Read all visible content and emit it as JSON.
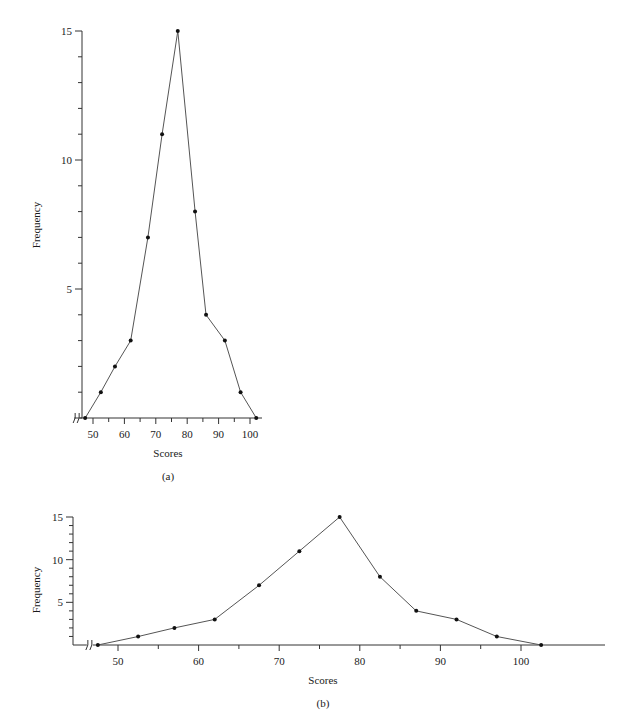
{
  "chart_data": [
    {
      "id": "a",
      "type": "line",
      "caption": "(a)",
      "title": "",
      "xlabel": "Scores",
      "ylabel": "Frequency",
      "x_ticks": [
        50,
        60,
        70,
        80,
        90,
        100
      ],
      "y_ticks": [
        5,
        10,
        15
      ],
      "y_minor_step": 1,
      "xlim": [
        45,
        104
      ],
      "ylim": [
        0,
        15
      ],
      "axis_break": true,
      "grid": false,
      "x": [
        47.5,
        52.5,
        57,
        62,
        67.5,
        72,
        77,
        82.5,
        86,
        92,
        97,
        102
      ],
      "values": [
        0,
        1,
        2,
        3,
        7,
        11,
        15,
        8,
        4,
        3,
        1,
        0
      ]
    },
    {
      "id": "b",
      "type": "line",
      "caption": "(b)",
      "title": "",
      "xlabel": "Scores",
      "ylabel": "Frequency",
      "x_ticks": [
        50,
        60,
        70,
        80,
        90,
        100
      ],
      "y_ticks": [
        5,
        10,
        15
      ],
      "y_minor_step": 1,
      "xlim": [
        45,
        105
      ],
      "ylim": [
        0,
        15
      ],
      "axis_break": true,
      "grid": false,
      "x": [
        47.5,
        52.5,
        57,
        62,
        67.5,
        72.5,
        77.5,
        82.5,
        87,
        92,
        97,
        102.5
      ],
      "values": [
        0,
        1,
        2,
        3,
        7,
        11,
        15,
        8,
        4,
        3,
        1,
        0
      ]
    }
  ],
  "labels": {
    "a": {
      "xlabel": "Scores",
      "ylabel": "Frequency",
      "caption": "(a)",
      "xticks": [
        "50",
        "60",
        "70",
        "80",
        "90",
        "100"
      ],
      "yticks": [
        "5",
        "10",
        "15"
      ]
    },
    "b": {
      "xlabel": "Scores",
      "ylabel": "Frequency",
      "caption": "(b)",
      "xticks": [
        "50",
        "60",
        "70",
        "80",
        "90",
        "100"
      ],
      "yticks": [
        "5",
        "10",
        "15"
      ]
    }
  },
  "colors": {
    "line": "#555555",
    "marker": "#111111",
    "axis": "#333333"
  }
}
